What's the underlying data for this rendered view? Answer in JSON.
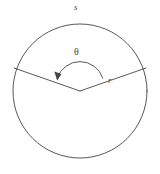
{
  "figure": {
    "kind": "geometry-diagram",
    "background_color": "#ffffff",
    "stroke_color": "#444444",
    "label_color": "#4a4a4a",
    "labels": {
      "arc_length": "s",
      "angle": "θ",
      "radius": "r"
    },
    "geometry": {
      "circle": {
        "center_x": 80,
        "center_y": 91,
        "radius": 67
      },
      "radius_left_endpoint": {
        "x": 14,
        "y": 68
      },
      "radius_right_endpoint": {
        "x": 146,
        "y": 68
      },
      "angle_arc": {
        "radius": 24,
        "start_x": 57,
        "start_y": 78,
        "end_x": 103,
        "end_y": 78,
        "arrowhead_at": "start"
      }
    }
  }
}
